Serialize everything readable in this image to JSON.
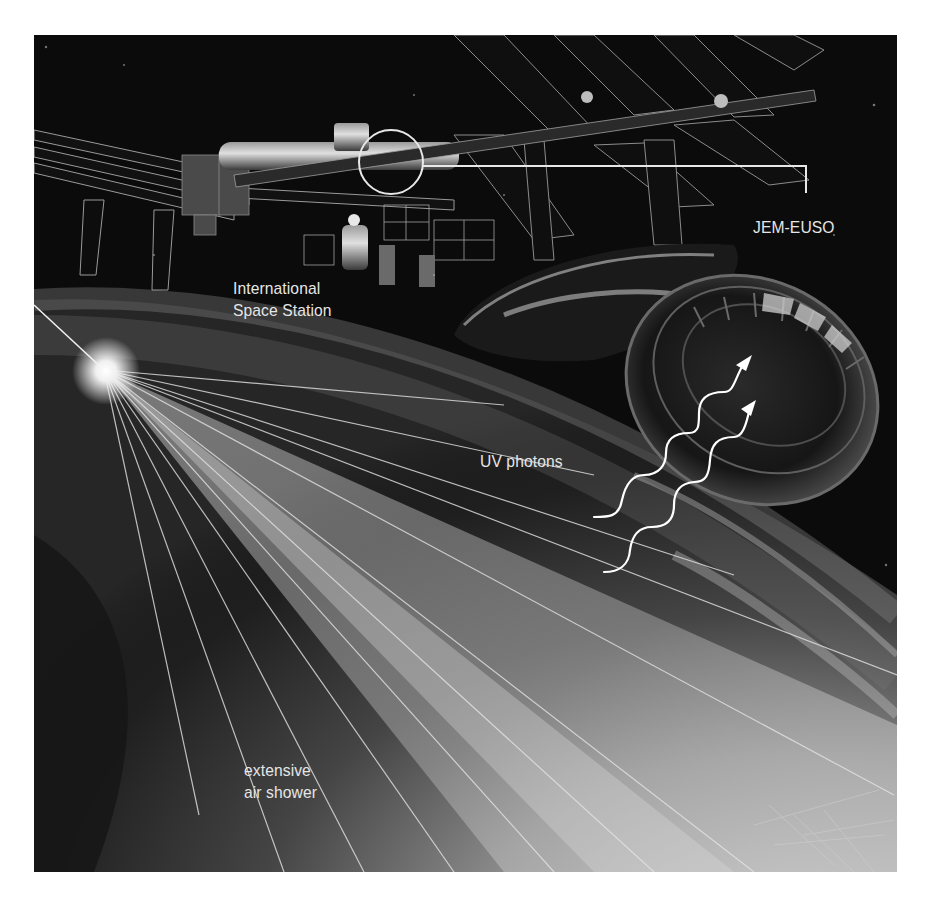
{
  "figure": {
    "labels": {
      "jem_euso": "JEM-EUSO",
      "iss_line1": "International",
      "iss_line2": "Space Station",
      "uv_photons": "UV photons",
      "eas_line1": "extensive",
      "eas_line2": "air shower"
    },
    "callout": {
      "target": "JEM-EUSO module on ISS",
      "style": "white circle with leader line"
    },
    "annotations": {
      "photon_arrows": 2,
      "photon_arrow_style": "white wavy line with arrowhead"
    },
    "colors": {
      "background": "#0b0b0b",
      "label_text": "#e6e6e6",
      "callout_line": "#e8e8e8",
      "earth_haze": "#8a8a8a",
      "page": "#ffffff"
    }
  }
}
